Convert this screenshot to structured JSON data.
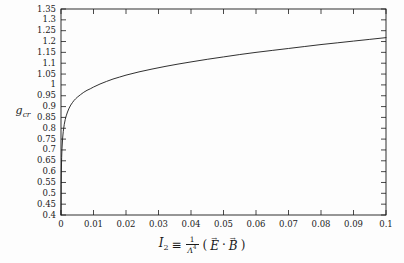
{
  "figure": {
    "background_color": "#fdfdfd",
    "frame_color": "#1a1a1a",
    "curve_color": "#1a1a1a"
  },
  "axis_labels": {
    "y_label_main": "g",
    "y_label_sub": "cr",
    "x_label_symbol": "I",
    "x_label_symbol_sub": "2",
    "x_label_equiv": "≡",
    "x_label_frac_num": "1",
    "x_label_frac_den": "Λ",
    "x_label_frac_den_sup": "4",
    "x_label_open_paren": "(",
    "x_label_E": "E",
    "x_label_dot": "·",
    "x_label_B": "B",
    "x_label_close_paren": ")",
    "vector_arrow": "→"
  },
  "chart_data": {
    "type": "line",
    "title": "",
    "xlabel": "I_2 = (1/Λ^4)(E⃗ · B⃗)",
    "ylabel": "g_cr",
    "xlim": [
      0,
      0.1
    ],
    "ylim": [
      0.4,
      1.35
    ],
    "grid": false,
    "legend": "none",
    "x_ticks": [
      0,
      0.01,
      0.02,
      0.03,
      0.04,
      0.05,
      0.06,
      0.07,
      0.08,
      0.09,
      0.1
    ],
    "x_tick_labels": [
      "0",
      "0.01",
      "0.02",
      "0.03",
      "0.04",
      "0.05",
      "0.06",
      "0.07",
      "0.08",
      "0.09",
      "0.1"
    ],
    "y_ticks": [
      0.4,
      0.45,
      0.5,
      0.55,
      0.6,
      0.65,
      0.7,
      0.75,
      0.8,
      0.85,
      0.9,
      0.95,
      1,
      1.05,
      1.1,
      1.15,
      1.2,
      1.25,
      1.3,
      1.35
    ],
    "y_tick_labels": [
      "0.4",
      "0.45",
      "0.5",
      "0.55",
      "0.6",
      "0.65",
      "0.7",
      "0.75",
      "0.8",
      "0.85",
      "0.9",
      "0.95",
      "1",
      "1.05",
      "1.1",
      "1.15",
      "1.2",
      "1.25",
      "1.3",
      "1.35"
    ],
    "series": [
      {
        "name": "g_cr",
        "x": [
          0.0,
          5e-05,
          0.0001,
          0.0002,
          0.0003,
          0.0005,
          0.0007,
          0.001,
          0.0013,
          0.0016,
          0.002,
          0.0025,
          0.003,
          0.0035,
          0.004,
          0.0045,
          0.005,
          0.006,
          0.007,
          0.008,
          0.009,
          0.01,
          0.012,
          0.014,
          0.016,
          0.018,
          0.02,
          0.024,
          0.028,
          0.032,
          0.036,
          0.04,
          0.045,
          0.05,
          0.055,
          0.06,
          0.065,
          0.07,
          0.075,
          0.08,
          0.085,
          0.09,
          0.095,
          0.1
        ],
        "y": [
          0.4,
          0.54,
          0.6,
          0.665,
          0.705,
          0.755,
          0.785,
          0.818,
          0.84,
          0.857,
          0.875,
          0.893,
          0.907,
          0.918,
          0.928,
          0.936,
          0.943,
          0.955,
          0.966,
          0.975,
          0.982,
          0.99,
          1.004,
          1.016,
          1.027,
          1.036,
          1.045,
          1.06,
          1.073,
          1.085,
          1.096,
          1.106,
          1.118,
          1.129,
          1.14,
          1.15,
          1.159,
          1.168,
          1.177,
          1.186,
          1.194,
          1.202,
          1.21,
          1.218
        ]
      }
    ]
  },
  "plot_geometry": {
    "left": 61,
    "right": 386,
    "top": 9,
    "bottom": 215
  }
}
